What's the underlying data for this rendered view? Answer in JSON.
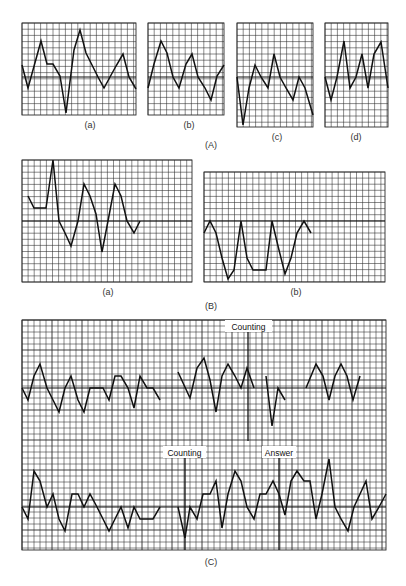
{
  "figure": {
    "section_labels": {
      "A": "(A)",
      "B": "(B)",
      "C": "(C)"
    },
    "caption_fragment": ""
  },
  "colors": {
    "grid": "#2a2a2a",
    "trace": "#111111",
    "background": "#ffffff"
  },
  "panels": [
    {
      "id": "A-a",
      "label": "(a)",
      "box": [
        22,
        23,
        136,
        115
      ],
      "cell": 6.2,
      "baseline": 77,
      "label_pos": [
        90,
        128
      ],
      "trace": [
        [
          22,
          65
        ],
        [
          28,
          88
        ],
        [
          41,
          41
        ],
        [
          47,
          64
        ],
        [
          53,
          64
        ],
        [
          60,
          76
        ],
        [
          66,
          113
        ],
        [
          74,
          50
        ],
        [
          80,
          30
        ],
        [
          86,
          53
        ],
        [
          92,
          65
        ],
        [
          98,
          77
        ],
        [
          104,
          88
        ],
        [
          110,
          77
        ],
        [
          116,
          66
        ],
        [
          123,
          54
        ],
        [
          129,
          77
        ],
        [
          136,
          89
        ]
      ]
    },
    {
      "id": "A-b",
      "label": "(b)",
      "box": [
        148,
        23,
        224,
        115
      ],
      "cell": 6.2,
      "baseline": 77,
      "label_pos": [
        189,
        128
      ],
      "trace": [
        [
          148,
          88
        ],
        [
          154,
          64
        ],
        [
          161,
          41
        ],
        [
          167,
          53
        ],
        [
          173,
          77
        ],
        [
          179,
          88
        ],
        [
          186,
          64
        ],
        [
          192,
          54
        ],
        [
          198,
          77
        ],
        [
          205,
          88
        ],
        [
          211,
          100
        ],
        [
          217,
          76
        ],
        [
          224,
          65
        ]
      ]
    },
    {
      "id": "A-c",
      "label": "(c)",
      "box": [
        237,
        23,
        313,
        127
      ],
      "cell": 6.2,
      "baseline": 77,
      "label_pos": [
        277,
        140
      ],
      "trace": [
        [
          237,
          77
        ],
        [
          243,
          125
        ],
        [
          249,
          88
        ],
        [
          255,
          65
        ],
        [
          261,
          77
        ],
        [
          268,
          88
        ],
        [
          274,
          54
        ],
        [
          280,
          77
        ],
        [
          286,
          88
        ],
        [
          293,
          100
        ],
        [
          299,
          77
        ],
        [
          305,
          88
        ],
        [
          313,
          115
        ]
      ]
    },
    {
      "id": "A-d",
      "label": "(d)",
      "box": [
        325,
        23,
        388,
        127
      ],
      "cell": 6.2,
      "baseline": 77,
      "label_pos": [
        356,
        140
      ],
      "trace": [
        [
          325,
          77
        ],
        [
          331,
          100
        ],
        [
          337,
          77
        ],
        [
          344,
          41
        ],
        [
          350,
          88
        ],
        [
          356,
          77
        ],
        [
          362,
          54
        ],
        [
          368,
          88
        ],
        [
          374,
          54
        ],
        [
          381,
          42
        ],
        [
          388,
          88
        ]
      ]
    }
  ],
  "panels_B": [
    {
      "id": "B-a",
      "label": "(a)",
      "box": [
        22,
        160,
        192,
        282
      ],
      "cell": 6.1,
      "baseline": 221,
      "label_pos": [
        108,
        295
      ],
      "trace": [
        [
          28,
          196
        ],
        [
          34,
          208
        ],
        [
          46,
          208
        ],
        [
          53,
          160
        ],
        [
          59,
          221
        ],
        [
          65,
          233
        ],
        [
          71,
          246
        ],
        [
          78,
          221
        ],
        [
          84,
          184
        ],
        [
          90,
          196
        ],
        [
          96,
          214
        ],
        [
          102,
          252
        ],
        [
          108,
          221
        ],
        [
          115,
          184
        ],
        [
          121,
          196
        ],
        [
          127,
          221
        ],
        [
          134,
          233
        ],
        [
          140,
          221
        ]
      ]
    },
    {
      "id": "B-b",
      "label": "(b)",
      "box": [
        204,
        172,
        385,
        282
      ],
      "cell": 6.1,
      "baseline": 221,
      "label_pos": [
        296,
        295
      ],
      "trace": [
        [
          204,
          233
        ],
        [
          210,
          221
        ],
        [
          216,
          233
        ],
        [
          222,
          258
        ],
        [
          228,
          279
        ],
        [
          234,
          270
        ],
        [
          241,
          221
        ],
        [
          247,
          258
        ],
        [
          253,
          270
        ],
        [
          266,
          270
        ],
        [
          272,
          221
        ],
        [
          278,
          246
        ],
        [
          285,
          274
        ],
        [
          291,
          258
        ],
        [
          297,
          233
        ],
        [
          304,
          221
        ],
        [
          311,
          233
        ]
      ]
    }
  ],
  "panel_C": {
    "label": "(C)",
    "box": [
      22,
      320,
      386,
      550
    ],
    "cell": 6.0,
    "baseline_top": 388,
    "baseline_bottom": 507,
    "markers": [
      {
        "text": "Counting",
        "x": 248,
        "y1": 320,
        "y2": 441,
        "label_box": [
          225,
          320,
          272,
          332
        ]
      },
      {
        "text": "Counting",
        "x": 185,
        "y1": 446,
        "y2": 550,
        "label_box": [
          163,
          446,
          206,
          458
        ]
      },
      {
        "text": "Answer",
        "x": 279,
        "y1": 446,
        "y2": 550,
        "label_box": [
          262,
          446,
          296,
          458
        ]
      }
    ],
    "traces": [
      [
        [
          22,
          388
        ],
        [
          28,
          400
        ],
        [
          34,
          376
        ],
        [
          40,
          364
        ],
        [
          47,
          388
        ],
        [
          53,
          400
        ],
        [
          59,
          412
        ],
        [
          65,
          388
        ],
        [
          71,
          376
        ],
        [
          78,
          400
        ],
        [
          84,
          412
        ],
        [
          90,
          388
        ],
        [
          103,
          388
        ],
        [
          109,
          400
        ],
        [
          115,
          376
        ],
        [
          121,
          376
        ],
        [
          128,
          388
        ],
        [
          134,
          408
        ],
        [
          140,
          376
        ],
        [
          147,
          388
        ],
        [
          153,
          388
        ],
        [
          160,
          400
        ]
      ],
      [
        [
          178,
          372
        ],
        [
          190,
          398
        ],
        [
          197,
          368
        ],
        [
          204,
          358
        ],
        [
          210,
          380
        ],
        [
          216,
          412
        ],
        [
          222,
          376
        ],
        [
          228,
          364
        ],
        [
          235,
          376
        ],
        [
          241,
          388
        ],
        [
          247,
          368
        ],
        [
          254,
          388
        ]
      ],
      [
        [
          266,
          376
        ],
        [
          272,
          426
        ],
        [
          278,
          388
        ],
        [
          285,
          400
        ]
      ],
      [
        [
          306,
          388
        ],
        [
          316,
          364
        ],
        [
          323,
          376
        ],
        [
          329,
          400
        ],
        [
          335,
          376
        ],
        [
          341,
          364
        ],
        [
          347,
          376
        ],
        [
          353,
          400
        ],
        [
          360,
          376
        ]
      ],
      [
        [
          22,
          507
        ],
        [
          28,
          519
        ],
        [
          34,
          471
        ],
        [
          40,
          481
        ],
        [
          47,
          507
        ],
        [
          53,
          494
        ],
        [
          59,
          519
        ],
        [
          65,
          531
        ],
        [
          72,
          494
        ],
        [
          78,
          494
        ],
        [
          84,
          507
        ],
        [
          90,
          494
        ],
        [
          97,
          507
        ],
        [
          103,
          519
        ],
        [
          109,
          531
        ],
        [
          115,
          519
        ],
        [
          121,
          507
        ],
        [
          128,
          528
        ],
        [
          134,
          507
        ],
        [
          140,
          519
        ],
        [
          153,
          519
        ],
        [
          160,
          507
        ]
      ],
      [
        [
          178,
          507
        ],
        [
          185,
          538
        ],
        [
          190,
          507
        ],
        [
          197,
          519
        ],
        [
          203,
          494
        ],
        [
          210,
          494
        ],
        [
          216,
          481
        ],
        [
          222,
          528
        ],
        [
          228,
          494
        ],
        [
          235,
          471
        ],
        [
          241,
          481
        ],
        [
          247,
          507
        ],
        [
          254,
          519
        ],
        [
          260,
          494
        ],
        [
          266,
          494
        ],
        [
          273,
          481
        ],
        [
          279,
          494
        ],
        [
          285,
          515
        ],
        [
          291,
          481
        ],
        [
          297,
          471
        ],
        [
          304,
          481
        ],
        [
          310,
          481
        ],
        [
          316,
          519
        ],
        [
          322,
          494
        ],
        [
          329,
          459
        ],
        [
          335,
          507
        ],
        [
          341,
          519
        ],
        [
          348,
          531
        ],
        [
          354,
          507
        ],
        [
          360,
          494
        ],
        [
          366,
          481
        ],
        [
          372,
          519
        ],
        [
          379,
          507
        ],
        [
          386,
          494
        ]
      ]
    ]
  }
}
